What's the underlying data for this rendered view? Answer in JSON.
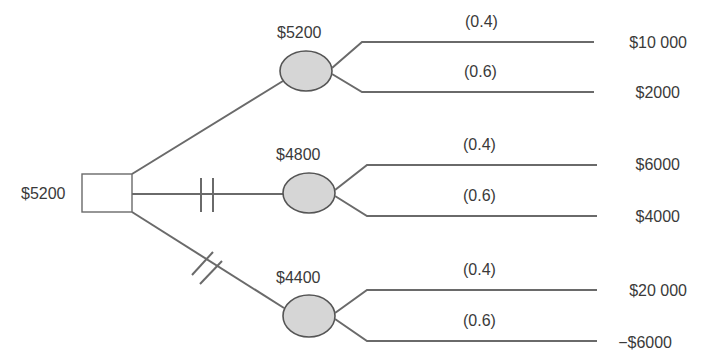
{
  "diagram": {
    "type": "decision-tree",
    "colors": {
      "line": "#6a6a6a",
      "node_fill": "#d6d6d6",
      "node_stroke": "#555555",
      "text": "#3a3a3a"
    },
    "decision_node": {
      "value_label": "$5200"
    },
    "alternatives": [
      {
        "blocked": false,
        "expected_value": "$5200",
        "outcomes": [
          {
            "probability": "(0.4)",
            "payoff": "$10 000"
          },
          {
            "probability": "(0.6)",
            "payoff": "$2000"
          }
        ]
      },
      {
        "blocked": true,
        "expected_value": "$4800",
        "outcomes": [
          {
            "probability": "(0.4)",
            "payoff": "$6000"
          },
          {
            "probability": "(0.6)",
            "payoff": "$4000"
          }
        ]
      },
      {
        "blocked": true,
        "expected_value": "$4400",
        "outcomes": [
          {
            "probability": "(0.4)",
            "payoff": "$20 000"
          },
          {
            "probability": "(0.6)",
            "payoff": "−$6000"
          }
        ]
      }
    ]
  }
}
